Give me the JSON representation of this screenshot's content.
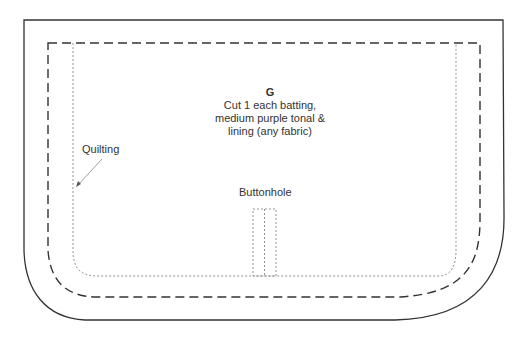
{
  "pattern_piece": {
    "letter": "G",
    "instructions": [
      "Cut 1 each batting,",
      "medium purple tonal &",
      "lining (any fabric)"
    ]
  },
  "labels": {
    "quilting": "Quilting",
    "buttonhole": "Buttonhole"
  },
  "lines": {
    "cut_line": "solid",
    "seam_line": "dashed",
    "quilting_line": "dotted"
  },
  "colors": {
    "outline": "#333333",
    "dotted": "#888888",
    "text": "#333333"
  }
}
